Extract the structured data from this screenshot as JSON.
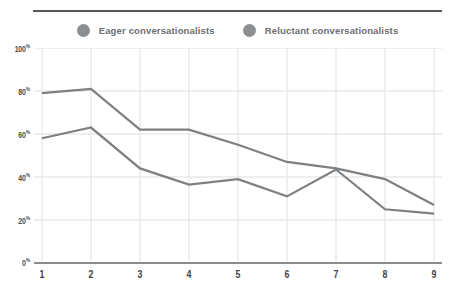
{
  "legend": {
    "position": "top-center",
    "items": [
      {
        "label": "Eager conversationalists",
        "color": "#8c8f92",
        "marker": "circle"
      },
      {
        "label": "Reluctant conversationalists",
        "color": "#8c8f92",
        "marker": "circle"
      }
    ]
  },
  "colors": {
    "series_line": "#7d8083",
    "gridline": "#e8e9ea",
    "axis": "#8a8d90",
    "top_rule": "#56595c",
    "y_label": "#4c4f52",
    "x_label": "#3f4245",
    "legend_text": "#6b6e71",
    "background": "#ffffff"
  },
  "chart_data": {
    "type": "line",
    "title": "",
    "subtitle": "",
    "xlabel": "",
    "ylabel": "",
    "x": [
      1,
      2,
      3,
      4,
      5,
      6,
      7,
      8,
      9
    ],
    "categories": [
      "1",
      "2",
      "3",
      "4",
      "5",
      "6",
      "7",
      "8",
      "9"
    ],
    "xtick_labels": [
      "1",
      "2",
      "3",
      "4",
      "5",
      "6",
      "7",
      "8",
      "9"
    ],
    "ytick_labels": [
      "0%",
      "20%",
      "40%",
      "60%",
      "80%",
      "100%"
    ],
    "ytick_values": [
      0,
      20,
      40,
      60,
      80,
      100
    ],
    "ylim": [
      0,
      100
    ],
    "xlim": [
      1,
      9
    ],
    "grid": true,
    "grid_axes": "both",
    "legend_position": "top-center",
    "series": [
      {
        "name": "Eager conversationalists",
        "color": "#7d8083",
        "values": [
          79,
          81,
          62,
          62,
          55,
          47,
          44,
          39,
          27
        ]
      },
      {
        "name": "Reluctant conversationalists",
        "color": "#7d8083",
        "values": [
          58,
          63,
          44,
          36.5,
          39,
          31,
          43.5,
          25,
          23
        ]
      }
    ],
    "annotations": []
  }
}
